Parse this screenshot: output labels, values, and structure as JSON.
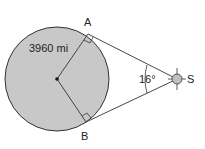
{
  "diagram": {
    "labels": {
      "point_a": "A",
      "point_b": "B",
      "point_s": "S",
      "radius": "3960 mi",
      "angle": "16°"
    },
    "colors": {
      "circle_fill": "#c8c8c8",
      "stroke": "#333333",
      "sun_fill": "#c0c0c0"
    }
  }
}
